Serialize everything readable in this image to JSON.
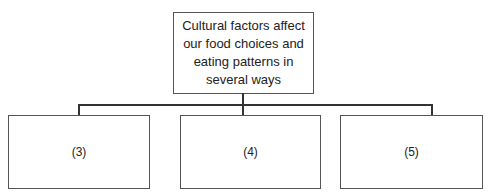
{
  "diagram": {
    "type": "tree",
    "root": {
      "label": "Cultural factors affect our food choices and eating patterns in several ways"
    },
    "children": [
      {
        "label": "(3)"
      },
      {
        "label": "(4)"
      },
      {
        "label": "(5)"
      }
    ]
  },
  "colors": {
    "border": "#555555",
    "line": "#333333",
    "background": "#ffffff"
  }
}
